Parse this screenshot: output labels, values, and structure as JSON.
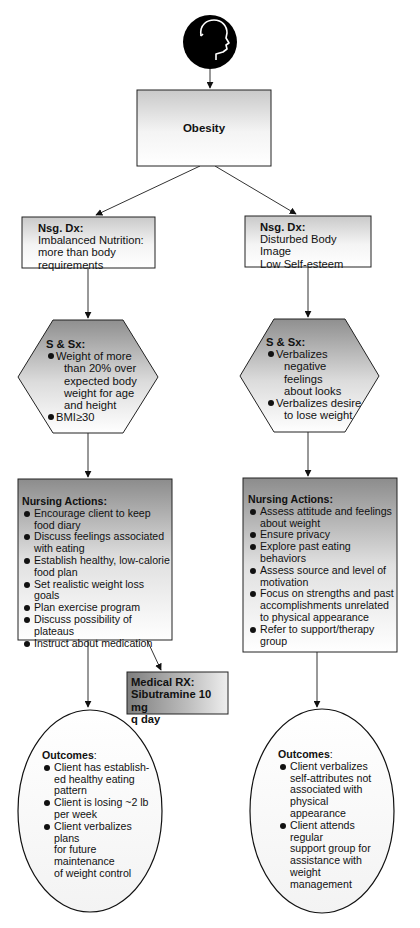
{
  "diagram": {
    "type": "nursing care flowchart",
    "root_icon": "head-profile-icon",
    "problem": {
      "label": "Obesity"
    },
    "branches": [
      {
        "side": "left",
        "nursing_diagnosis": {
          "title": "Nsg. Dx:",
          "lines": [
            "Imbalanced Nutrition:",
            "more than body",
            "requirements"
          ]
        },
        "signs_symptoms": {
          "title": "S & Sx:",
          "items": [
            "Weight of more than 20% over expected body weight for age and height",
            "BMI≥30"
          ]
        },
        "nursing_actions": {
          "title": "Nursing Actions:",
          "items": [
            "Encourage client to keep food diary",
            "Discuss feelings associated with eating",
            "Establish healthy, low-calorie food plan",
            "Set realistic weight loss goals",
            "Plan exercise program",
            "Discuss possibility of plateaus",
            "Instruct about medication"
          ]
        },
        "medical_rx": {
          "title": "Medical RX:",
          "lines": [
            "Sibutramine 10 mg",
            "q day"
          ]
        },
        "outcomes": {
          "title": "Outcomes",
          "title_suffix": ":",
          "items": [
            "Client has established healthy eating pattern",
            "Client is losing ~2 lb per week",
            "Client verbalizes plans for future maintenance of weight control"
          ]
        }
      },
      {
        "side": "right",
        "nursing_diagnosis": {
          "title": "Nsg. Dx:",
          "lines": [
            "Disturbed Body Image",
            "Low Self-esteem"
          ]
        },
        "signs_symptoms": {
          "title": "S & Sx:",
          "items": [
            "Verbalizes negative feelings about looks",
            "Verbalizes desire to lose weight"
          ]
        },
        "nursing_actions": {
          "title": "Nursing Actions:",
          "items": [
            "Assess attitude and feelings about weight",
            "Ensure privacy",
            "Explore past eating behaviors",
            "Assess source and level of motivation",
            "Focus on strengths and past accomplishments unrelated to physical appearance",
            "Refer to support/therapy group"
          ]
        },
        "outcomes": {
          "title": "Outcomes",
          "title_suffix": ":",
          "items": [
            "Client verbalizes self-attributes not associated with physical appearance",
            "Client attends regular support group for assistance with weight management"
          ]
        }
      }
    ],
    "display_lines": {
      "left_hex": [
        "Weight of more",
        "than 20% over",
        "expected body",
        "weight for age",
        "and height"
      ],
      "left_outcome_1": [
        "Client has establish-",
        "ed healthy eating",
        "pattern"
      ],
      "left_outcome_2": [
        "Client is losing ~2 lb",
        "per week"
      ],
      "left_outcome_3": [
        "Client verbalizes plans",
        "for future maintenance",
        "of weight control"
      ],
      "right_hex_1": [
        "Verbalizes",
        "negative feelings",
        "about looks"
      ],
      "right_hex_2": [
        "Verbalizes desire",
        "to lose weight"
      ],
      "right_outcome_1": [
        "Client verbalizes",
        "self-attributes not",
        "associated with",
        "physical appearance"
      ],
      "right_outcome_2": [
        "Client attends regular",
        "support group for",
        "assistance with weight",
        "management"
      ]
    },
    "colors": {
      "stroke": "#1a1a1a",
      "shade_dark": "#9a9a9a",
      "shade_light": "#ffffff",
      "head_fill": "#000000"
    }
  }
}
